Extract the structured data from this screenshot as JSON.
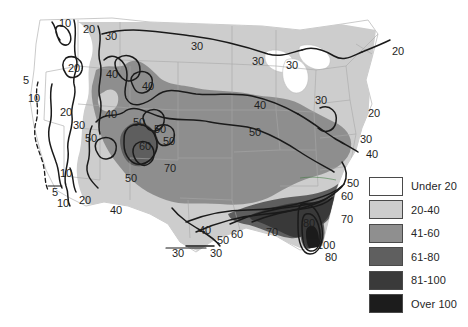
{
  "figure": {
    "type": "contour-map",
    "region": "continental-united-states",
    "background_color": "#ffffff",
    "line_color": "#1a1a1a",
    "border_color": "#b0b0b0"
  },
  "legend": {
    "title": "",
    "x": 369,
    "y": 176,
    "entries": [
      {
        "label": "Under 20",
        "color": "#ffffff",
        "min": null,
        "max": 20
      },
      {
        "label": "20-40",
        "color": "#cdcdcd",
        "min": 20,
        "max": 40
      },
      {
        "label": "41-60",
        "color": "#8f8f8f",
        "min": 41,
        "max": 60
      },
      {
        "label": "61-80",
        "color": "#5f5f5f",
        "min": 61,
        "max": 80
      },
      {
        "label": "81-100",
        "color": "#3a3a3a",
        "min": 81,
        "max": 100
      },
      {
        "label": "Over 100",
        "color": "#1c1c1c",
        "min": 100,
        "max": null
      }
    ]
  },
  "chart_data": {
    "type": "contour-map",
    "title": "",
    "xlabel": "",
    "ylabel": "",
    "contour_levels": [
      5,
      10,
      20,
      30,
      40,
      50,
      60,
      70,
      80,
      100
    ],
    "class_breaks": [
      20,
      40,
      60,
      80,
      100
    ],
    "class_labels": [
      "Under 20",
      "20-40",
      "41-60",
      "61-80",
      "81-100",
      "Over 100"
    ],
    "class_colors": [
      "#ffffff",
      "#cdcdcd",
      "#8f8f8f",
      "#5f5f5f",
      "#3a3a3a",
      "#1c1c1c"
    ],
    "value_range": [
      5,
      100
    ],
    "gradient_description": "Values increase from the Pacific coast and Pacific Northwest (5-10) eastward and southward, peaking over the Gulf Coast and Florida peninsula (over 100), with a secondary high over the southern Rocky Mountains (60-70).",
    "contour_labels": [
      {
        "value": 10,
        "x": 59,
        "y": 17
      },
      {
        "value": 20,
        "x": 83,
        "y": 23
      },
      {
        "value": 30,
        "x": 105,
        "y": 30
      },
      {
        "value": 30,
        "x": 191,
        "y": 40
      },
      {
        "value": 20,
        "x": 68,
        "y": 62
      },
      {
        "value": 40,
        "x": 106,
        "y": 68
      },
      {
        "value": 40,
        "x": 142,
        "y": 80
      },
      {
        "value": 5,
        "x": 23,
        "y": 74
      },
      {
        "value": 10,
        "x": 28,
        "y": 92
      },
      {
        "value": 30,
        "x": 252,
        "y": 55
      },
      {
        "value": 30,
        "x": 286,
        "y": 59
      },
      {
        "value": 20,
        "x": 392,
        "y": 45
      },
      {
        "value": 40,
        "x": 254,
        "y": 99
      },
      {
        "value": 20,
        "x": 60,
        "y": 106
      },
      {
        "value": 30,
        "x": 73,
        "y": 119
      },
      {
        "value": 40,
        "x": 105,
        "y": 108
      },
      {
        "value": 50,
        "x": 133,
        "y": 116
      },
      {
        "value": 50,
        "x": 154,
        "y": 123
      },
      {
        "value": 50,
        "x": 163,
        "y": 135
      },
      {
        "value": 50,
        "x": 85,
        "y": 132
      },
      {
        "value": 60,
        "x": 139,
        "y": 140
      },
      {
        "value": 50,
        "x": 249,
        "y": 126
      },
      {
        "value": 30,
        "x": 315,
        "y": 94
      },
      {
        "value": 20,
        "x": 368,
        "y": 107
      },
      {
        "value": 30,
        "x": 360,
        "y": 133
      },
      {
        "value": 40,
        "x": 366,
        "y": 148
      },
      {
        "value": 70,
        "x": 164,
        "y": 162
      },
      {
        "value": 50,
        "x": 125,
        "y": 172
      },
      {
        "value": 10,
        "x": 60,
        "y": 167
      },
      {
        "value": 5,
        "x": 52,
        "y": 186
      },
      {
        "value": 10,
        "x": 57,
        "y": 197
      },
      {
        "value": 20,
        "x": 79,
        "y": 194
      },
      {
        "value": 40,
        "x": 110,
        "y": 204
      },
      {
        "value": 50,
        "x": 347,
        "y": 177
      },
      {
        "value": 60,
        "x": 341,
        "y": 190
      },
      {
        "value": 40,
        "x": 199,
        "y": 224
      },
      {
        "value": 50,
        "x": 217,
        "y": 234
      },
      {
        "value": 60,
        "x": 231,
        "y": 228
      },
      {
        "value": 70,
        "x": 266,
        "y": 226
      },
      {
        "value": 80,
        "x": 303,
        "y": 217
      },
      {
        "value": 70,
        "x": 341,
        "y": 213
      },
      {
        "value": 100,
        "x": 317,
        "y": 239
      },
      {
        "value": 80,
        "x": 325,
        "y": 251
      },
      {
        "value": 30,
        "x": 172,
        "y": 247
      },
      {
        "value": 30,
        "x": 210,
        "y": 247
      }
    ]
  }
}
